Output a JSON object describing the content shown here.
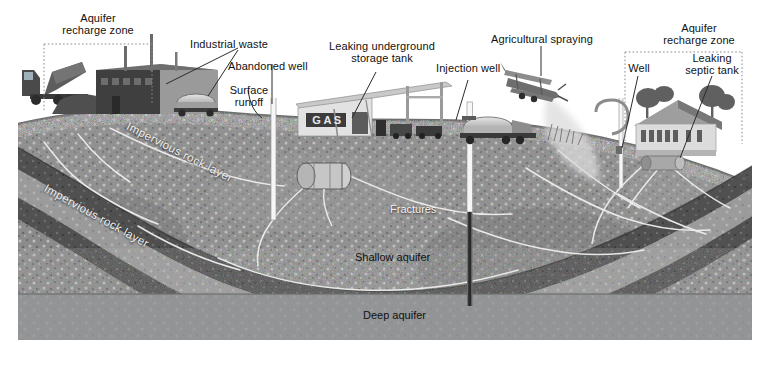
{
  "figure": {
    "type": "illustrated-cross-section"
  },
  "surface_labels": [
    {
      "id": "aquifer-recharge-zone-left",
      "text": "Aquifer\nrecharge zone"
    },
    {
      "id": "industrial-waste",
      "text": "Industrial waste"
    },
    {
      "id": "abandoned-well",
      "text": "Abandoned well"
    },
    {
      "id": "surface-runoff",
      "text": "Surface\nrunoff"
    },
    {
      "id": "leaking-underground-storage-tank",
      "text": "Leaking underground\nstorage tank"
    },
    {
      "id": "injection-well",
      "text": "Injection well"
    },
    {
      "id": "agricultural-spraying",
      "text": "Agricultural spraying"
    },
    {
      "id": "aquifer-recharge-zone-right",
      "text": "Aquifer\nrecharge zone"
    },
    {
      "id": "well",
      "text": "Well"
    },
    {
      "id": "leaking-septic-tank",
      "text": "Leaking\nseptic tank"
    }
  ],
  "subsurface_labels": [
    {
      "id": "impervious-rock-layer-upper",
      "text": "Impervious rock layer"
    },
    {
      "id": "impervious-rock-layer-lower",
      "text": "Impervious rock layer"
    },
    {
      "id": "fractures",
      "text": "Fractures"
    },
    {
      "id": "shallow-aquifer",
      "text": "Shallow aquifer"
    },
    {
      "id": "deep-aquifer",
      "text": "Deep aquifer"
    }
  ],
  "scene_text": {
    "gas_station_sign": "GAS"
  },
  "colors": {
    "label_text": "#111111",
    "label_text_light": "#f2f2f2",
    "leader_line": "#2b2b2b",
    "recharge_zone_border": "#8a8a8a",
    "rock_mid": "#8d8d8d",
    "rock_dark": "#4e4e4e",
    "aquifer_gray": "#9a9a9a",
    "deep_aquifer": "#8f9193",
    "well_pipe": "#f5f5f5",
    "fracture_line": "#f0f0f0",
    "background": "#ffffff"
  }
}
